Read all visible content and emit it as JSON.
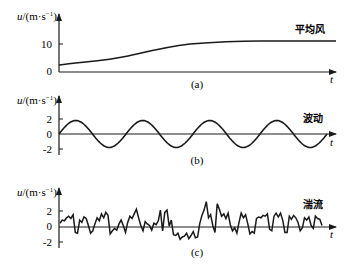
{
  "chart_data": [
    {
      "type": "line",
      "panel": "(a)",
      "title": "平均风",
      "ylabel": "u/(m·s⁻¹)",
      "xlabel": "t",
      "yticks": [
        "0",
        "10"
      ],
      "ylim": [
        0,
        14
      ],
      "grid": false,
      "description": "Mean wind: rises smoothly from ~2 to ~10 m/s then levels off",
      "x": [
        0,
        0.1,
        0.2,
        0.3,
        0.4,
        0.5,
        0.6,
        0.7,
        0.8,
        0.9,
        1.0
      ],
      "values": [
        2.2,
        3.4,
        4.3,
        5.6,
        7.3,
        8.8,
        9.8,
        10.2,
        10.3,
        10.3,
        10.3
      ]
    },
    {
      "type": "line",
      "panel": "(b)",
      "title": "波动",
      "ylabel": "u/(m·s⁻¹)",
      "xlabel": "t",
      "yticks": [
        "2",
        "0",
        "-2"
      ],
      "ylim": [
        -2.5,
        2.5
      ],
      "grid": false,
      "description": "Fluctuation: sinusoid amplitude ~1.8, about 4 full periods",
      "amplitude": 1.8,
      "periods": 4
    },
    {
      "type": "line",
      "panel": "(c)",
      "title": "湍流",
      "ylabel": "u/(m·s⁻¹)",
      "xlabel": "t",
      "yticks": [
        "2",
        "0",
        "-2"
      ],
      "ylim": [
        -2.5,
        3.5
      ],
      "grid": false,
      "description": "Turbulence: irregular random fluctuation around 0, range roughly -1.8 to 3.3",
      "values": [
        0.5,
        0.9,
        0.8,
        1.2,
        1.4,
        1.1,
        1.6,
        -0.7,
        -0.8,
        0.9,
        0.6,
        1.3,
        1.1,
        0.2,
        -0.8,
        -0.5,
        0.4,
        1.2,
        0.8,
        1.7,
        1.2,
        1.9,
        1.5,
        -0.9,
        -0.5,
        -0.2,
        -0.4,
        0.4,
        0.9,
        0.2,
        -0.7,
        0.6,
        1.4,
        1.1,
        1.7,
        2.3,
        1.2,
        0.2,
        -0.5,
        0.7,
        0.4,
        0.2,
        -0.4,
        0.5,
        0.3,
        0.8,
        2.2,
        -0.5,
        1.9,
        2.2,
        0.1,
        0.9,
        -1.0,
        -1.1,
        -0.8,
        -1.6,
        -1.3,
        -1.2,
        -0.8,
        -1.5,
        -1.1,
        -0.6,
        -1.4,
        -1.3,
        0.4,
        1.5,
        2.2,
        3.3,
        1.2,
        1.6,
        0.2,
        -0.7,
        3.0,
        2.3,
        1.4,
        1.7,
        1.1,
        1.8,
        0.3,
        -0.5,
        -0.1,
        -0.8,
        0.6,
        1.8,
        1.2,
        1.6,
        0.4,
        -0.9,
        -0.6,
        -0.8,
        1.1,
        1.3,
        1.2,
        1.5,
        1.4,
        1.7,
        -0.3,
        -0.5,
        1.4,
        1.8,
        1.3,
        1.8,
        0.9,
        -0.7,
        -0.7,
        1.4,
        1.0,
        1.5,
        1.2,
        0.6,
        -0.5,
        -0.1,
        1.2,
        0.9,
        1.3,
        0.2,
        -0.2,
        1.4,
        1.1,
        1.0,
        0.2
      ]
    }
  ],
  "labels": {
    "ylabel_a": "u/(m·s⁻¹)",
    "ylabel_b": "u/(m·s⁻¹)",
    "ylabel_c": "u/(m·s⁻¹)",
    "tick_a_10": "10",
    "tick_a_0": "0",
    "tick_b_2": "2",
    "tick_b_0": "0",
    "tick_b_m2": "-2",
    "tick_c_2": "2",
    "tick_c_0": "0",
    "tick_c_m2": "-2",
    "series_a": "平均风",
    "series_b": "波动",
    "series_c": "湍流",
    "caption_a": "(a)",
    "caption_b": "(b)",
    "caption_c": "(c)",
    "t": "t"
  }
}
